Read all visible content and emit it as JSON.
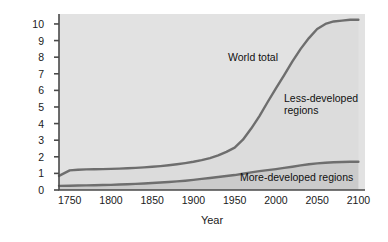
{
  "chart_data": {
    "type": "area",
    "title": "",
    "xlabel": "Year",
    "ylabel": "Billions of people",
    "xlim": [
      1737,
      2108
    ],
    "ylim": [
      0,
      10.6
    ],
    "grid": false,
    "legend_position": "inline-annotations",
    "xticks": [
      1750,
      1800,
      1850,
      1900,
      1950,
      2000,
      2050,
      2100
    ],
    "xtick_labels": [
      "1750",
      "1800",
      "1850",
      "1900",
      "1950",
      "2000",
      "2050",
      "2100"
    ],
    "yticks": [
      0,
      1,
      2,
      3,
      4,
      5,
      6,
      7,
      8,
      9,
      10
    ],
    "ytick_labels": [
      "0",
      "1",
      "2",
      "3",
      "4",
      "5",
      "6",
      "7",
      "8",
      "9",
      "10"
    ],
    "annotations": [
      {
        "text": "World total",
        "x": 1955,
        "y": 7.9
      },
      {
        "text": "Less-developed regions",
        "x": 2020,
        "y": 5.5
      },
      {
        "text": "More-developed regions",
        "x": 1975,
        "y": 0.85
      }
    ],
    "x": [
      1737,
      1750,
      1760,
      1770,
      1780,
      1790,
      1800,
      1810,
      1820,
      1830,
      1840,
      1850,
      1860,
      1870,
      1880,
      1890,
      1900,
      1910,
      1920,
      1930,
      1940,
      1950,
      1960,
      1970,
      1980,
      1990,
      2000,
      2010,
      2020,
      2030,
      2040,
      2050,
      2060,
      2070,
      2080,
      2090,
      2100
    ],
    "series": [
      {
        "name": "World total",
        "color": "#6e6e6e",
        "fill": "#d4d4d4",
        "values": [
          0.85,
          1.18,
          1.22,
          1.24,
          1.25,
          1.26,
          1.27,
          1.29,
          1.31,
          1.33,
          1.36,
          1.4,
          1.44,
          1.49,
          1.55,
          1.62,
          1.7,
          1.8,
          1.92,
          2.08,
          2.3,
          2.55,
          3.03,
          3.7,
          4.45,
          5.3,
          6.12,
          6.92,
          7.75,
          8.5,
          9.15,
          9.7,
          10.0,
          10.15,
          10.2,
          10.25,
          10.25
        ]
      },
      {
        "name": "More-developed regions",
        "color": "#6e6e6e",
        "fill": "#c0c0c0",
        "values": [
          0.25,
          0.26,
          0.27,
          0.28,
          0.29,
          0.3,
          0.31,
          0.33,
          0.35,
          0.37,
          0.39,
          0.42,
          0.45,
          0.48,
          0.52,
          0.56,
          0.61,
          0.67,
          0.72,
          0.78,
          0.84,
          0.9,
          0.98,
          1.06,
          1.14,
          1.2,
          1.26,
          1.33,
          1.4,
          1.48,
          1.55,
          1.6,
          1.64,
          1.67,
          1.69,
          1.7,
          1.7
        ]
      }
    ]
  },
  "plot": {
    "background_color": "#e2e2e2",
    "lower_band_color": "#cbcbcb",
    "upper_band_color": "#dcdcdc",
    "line_color": "#6e6e6e",
    "frame_color": "#4a4a4a",
    "page_background": "#ffffff"
  }
}
